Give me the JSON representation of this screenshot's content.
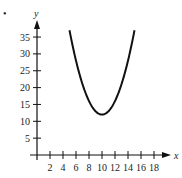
{
  "chart_data": {
    "type": "line",
    "title": "",
    "xlabel": "x",
    "ylabel": "y",
    "x_ticks": [
      2,
      4,
      6,
      8,
      10,
      12,
      14,
      16,
      18
    ],
    "y_ticks": [
      5,
      10,
      15,
      20,
      25,
      30,
      35
    ],
    "xlim": [
      0,
      19
    ],
    "ylim": [
      0,
      40
    ],
    "grid": false,
    "legend": null,
    "series": [
      {
        "name": "parabola",
        "equation": "y = (x - 10)^2 + 12",
        "x": [
          5,
          6,
          7,
          8,
          9,
          10,
          11,
          12,
          13,
          14,
          15
        ],
        "y": [
          37,
          28,
          21,
          16,
          13,
          12,
          13,
          16,
          21,
          28,
          37
        ]
      }
    ],
    "vertex": [
      10,
      12
    ],
    "color": "#111111"
  },
  "marker": "•"
}
